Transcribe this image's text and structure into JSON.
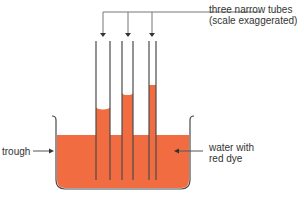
{
  "diagram": {
    "type": "capillary-action-experiment",
    "labels": {
      "tubes_line1": "three narrow tubes",
      "tubes_line2": "(scale exaggerated)",
      "trough": "trough",
      "water_line1": "water with",
      "water_line2": "red dye"
    },
    "colors": {
      "water": "#f26c41",
      "outline": "#4a4a4a",
      "arrow": "#555555",
      "text": "#333333"
    },
    "tubes": [
      {
        "name": "wide tube",
        "left": 96,
        "right": 110,
        "water_top": 107
      },
      {
        "name": "medium tube",
        "left": 122,
        "right": 133,
        "water_top": 93
      },
      {
        "name": "narrow tube",
        "left": 149,
        "right": 156,
        "water_top": 85
      }
    ]
  }
}
